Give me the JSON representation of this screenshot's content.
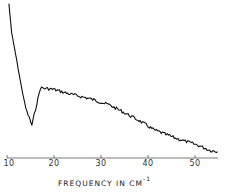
{
  "chart_data": {
    "type": "line",
    "title": "",
    "xlabel": "FREQUENCY IN CM",
    "xlabel_superscript": "-1",
    "ylabel": "",
    "xlim": [
      10,
      55
    ],
    "ylim": [
      0,
      1
    ],
    "grid": false,
    "legend": null,
    "x_ticks": [
      10,
      20,
      30,
      40,
      50
    ],
    "x_tick_labels": [
      "10",
      "20",
      "30",
      "40",
      "50"
    ],
    "series": [
      {
        "name": "spectrum",
        "x": [
          10.4,
          11.0,
          12.1,
          13.1,
          14.0,
          15.3,
          17.1,
          19.9,
          23.4,
          27.7,
          31.8,
          35.0,
          38.1,
          41.3,
          45.6,
          48.7,
          50.8,
          53.1,
          54.8
        ],
        "y": [
          0.99,
          0.8,
          0.62,
          0.45,
          0.32,
          0.21,
          0.45,
          0.44,
          0.41,
          0.38,
          0.34,
          0.29,
          0.24,
          0.18,
          0.13,
          0.1,
          0.08,
          0.05,
          0.04
        ]
      }
    ]
  },
  "axis": {
    "tick_labels": [
      "10",
      "20",
      "30",
      "40",
      "50"
    ],
    "xlabel_main": "FREQUENCY IN CM",
    "xlabel_sup": "-1"
  }
}
